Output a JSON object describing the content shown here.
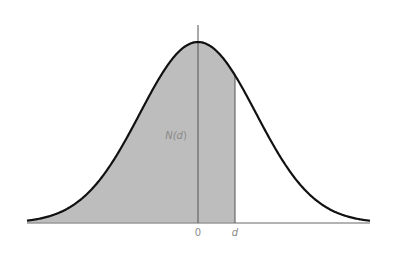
{
  "chart_data": {
    "type": "area",
    "title": "",
    "xlabel": "",
    "ylabel": "",
    "tick_labels": [
      "0",
      "d"
    ],
    "shaded_region": {
      "from": "-inf",
      "to": "d",
      "label": "N(d)"
    },
    "d_value_sigma": 0.64,
    "grid": false,
    "legend": null,
    "colors": {
      "curve": "#111111",
      "fill": "#bdbdbd",
      "baseline": "#9a9a9a",
      "lines": "#555555",
      "labels": "#8a8a8a"
    },
    "geometry": {
      "center_x": 198,
      "baseline_y": 223,
      "peak_y": 42,
      "sigma_px": 58,
      "x_start": 27,
      "x_end": 370,
      "d_x": 235,
      "zero_line_top": 25
    }
  },
  "labels": {
    "area": "N(d)",
    "zero": "0",
    "d": "d"
  }
}
